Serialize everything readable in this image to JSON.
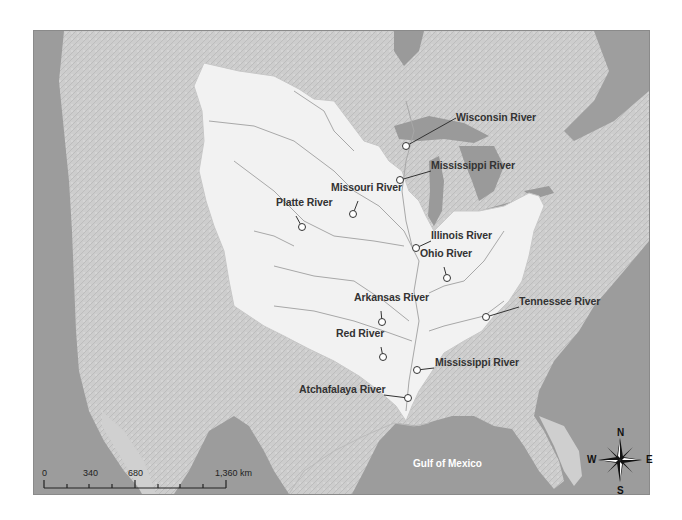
{
  "map": {
    "colors": {
      "ocean": "#9c9c9c",
      "land": "#cfcfcf",
      "basin": "#f2f2f2",
      "lakes": "#9a9a9a",
      "river_lines": "#a8a8a8",
      "label_text": "#333333",
      "leader_lines": "#333333"
    },
    "rivers": [
      {
        "name": "Wisconsin River",
        "marker": [
          405,
          145
        ],
        "label": [
          456,
          117
        ]
      },
      {
        "name": "Mississippi River",
        "marker": [
          399,
          179
        ],
        "label": [
          431,
          165
        ]
      },
      {
        "name": "Missouri River",
        "marker": [
          352,
          213
        ],
        "label": [
          331,
          187
        ]
      },
      {
        "name": "Platte River",
        "marker": [
          301,
          226
        ],
        "label": [
          276,
          202
        ]
      },
      {
        "name": "Illinois River",
        "marker": [
          415,
          247
        ],
        "label": [
          431,
          235
        ]
      },
      {
        "name": "Ohio River",
        "marker": [
          446,
          277
        ],
        "label": [
          420,
          253
        ]
      },
      {
        "name": "Tennessee River",
        "marker": [
          485,
          316
        ],
        "label": [
          519,
          301
        ]
      },
      {
        "name": "Arkansas River",
        "marker": [
          381,
          321
        ],
        "label": [
          354,
          297
        ]
      },
      {
        "name": "Red River",
        "marker": [
          382,
          356
        ],
        "label": [
          336,
          333
        ]
      },
      {
        "name": "Mississippi River",
        "marker": [
          416,
          369
        ],
        "label": [
          435,
          362
        ]
      },
      {
        "name": "Atchafalaya River",
        "marker": [
          407,
          397
        ],
        "label": [
          300,
          389
        ]
      }
    ],
    "water_label": "Gulf of Mexico",
    "scale_bar": {
      "labels": [
        "0",
        "340",
        "680",
        "1,360 km"
      ],
      "unit": "km"
    },
    "compass": {
      "north": "N",
      "south": "S",
      "east": "E",
      "west": "W"
    }
  }
}
